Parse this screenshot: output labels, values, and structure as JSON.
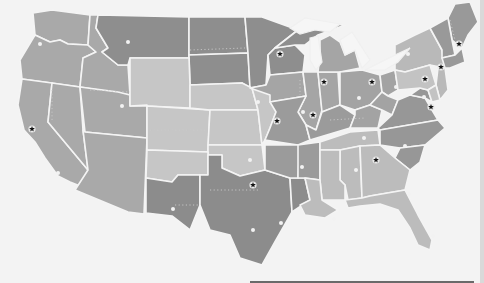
{
  "map": {
    "title": "United States regional districts map",
    "colors": {
      "background": "#f3f3f3",
      "dark": "#8c8c8c",
      "mid_dark": "#9a9a9a",
      "mid": "#a8a8a8",
      "light": "#bdbdbd",
      "lighter": "#c8c8c8",
      "border": "#f4f4f4",
      "star": "#111111",
      "dot": "#f2f2f2"
    },
    "legend": {
      "star": "district headquarters",
      "dot": "branch city"
    },
    "districts": [
      {
        "id": "west",
        "shade": "mid",
        "headquarters_marker": "star",
        "hq_xy": [
          32,
          129
        ]
      },
      {
        "id": "mountain-plains",
        "shade": "lighter",
        "headquarters_marker": "star",
        "hq_xy": [
          277,
          121
        ]
      },
      {
        "id": "upper-midwest",
        "shade": "dark",
        "headquarters_marker": "star",
        "hq_xy": [
          280,
          54
        ]
      },
      {
        "id": "central",
        "shade": "mid",
        "headquarters_marker": "star",
        "hq_xy": [
          324,
          82
        ]
      },
      {
        "id": "great-lakes-east",
        "shade": "mid",
        "headquarters_marker": "star",
        "hq_xy": [
          372,
          82
        ]
      },
      {
        "id": "mid-south",
        "shade": "mid_dark",
        "headquarters_marker": "star",
        "hq_xy": [
          313,
          115
        ]
      },
      {
        "id": "southwest",
        "shade": "dark",
        "headquarters_marker": "star",
        "hq_xy": [
          253,
          185
        ]
      },
      {
        "id": "southeast",
        "shade": "light",
        "headquarters_marker": "star",
        "hq_xy": [
          376,
          160
        ]
      },
      {
        "id": "mid-atlantic",
        "shade": "mid_dark",
        "headquarters_marker": "star",
        "hq_xy": [
          431,
          107
        ]
      },
      {
        "id": "northeast-central",
        "shade": "light",
        "headquarters_marker": "star",
        "hq_xy": [
          425,
          79
        ]
      },
      {
        "id": "new-york",
        "shade": "light",
        "headquarters_marker": "star",
        "hq_xy": [
          441,
          67
        ]
      },
      {
        "id": "new-england",
        "shade": "mid_dark",
        "headquarters_marker": "star",
        "hq_xy": [
          459,
          44
        ]
      }
    ],
    "stars": [
      {
        "x": 32,
        "y": 129
      },
      {
        "x": 280,
        "y": 54
      },
      {
        "x": 324,
        "y": 82
      },
      {
        "x": 372,
        "y": 82
      },
      {
        "x": 277,
        "y": 121
      },
      {
        "x": 313,
        "y": 115
      },
      {
        "x": 253,
        "y": 185
      },
      {
        "x": 376,
        "y": 160
      },
      {
        "x": 431,
        "y": 107
      },
      {
        "x": 425,
        "y": 79
      },
      {
        "x": 441,
        "y": 67
      },
      {
        "x": 459,
        "y": 44
      }
    ],
    "dots": [
      {
        "x": 40,
        "y": 44
      },
      {
        "x": 128,
        "y": 42
      },
      {
        "x": 122,
        "y": 106
      },
      {
        "x": 58,
        "y": 173
      },
      {
        "x": 173,
        "y": 209
      },
      {
        "x": 258,
        "y": 102
      },
      {
        "x": 250,
        "y": 160
      },
      {
        "x": 303,
        "y": 112
      },
      {
        "x": 359,
        "y": 98
      },
      {
        "x": 364,
        "y": 138
      },
      {
        "x": 408,
        "y": 54
      },
      {
        "x": 396,
        "y": 87
      },
      {
        "x": 424,
        "y": 97
      },
      {
        "x": 405,
        "y": 146
      },
      {
        "x": 302,
        "y": 167
      },
      {
        "x": 356,
        "y": 170
      },
      {
        "x": 253,
        "y": 230
      },
      {
        "x": 281,
        "y": 223
      },
      {
        "x": 334,
        "y": 219
      },
      {
        "x": 409,
        "y": 194
      },
      {
        "x": 433,
        "y": 236
      }
    ]
  }
}
